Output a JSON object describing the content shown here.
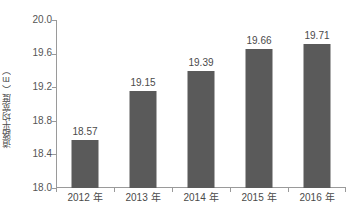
{
  "chart_data": {
    "type": "bar",
    "title": "",
    "subtitle": "",
    "xlabel": "",
    "ylabel": "道路平均宽度（m）",
    "categories": [
      "2012 年",
      "2013 年",
      "2014 年",
      "2015 年",
      "2016 年"
    ],
    "values": [
      18.57,
      19.15,
      19.39,
      19.66,
      19.71
    ],
    "data_labels": [
      "18.57",
      "19.15",
      "19.39",
      "19.66",
      "19.71"
    ],
    "ylim": [
      18.0,
      20.0
    ],
    "ytick_step": 0.4,
    "ytick_labels": [
      "20.0",
      "19.6",
      "19.2",
      "18.8",
      "18.4",
      "18.0"
    ],
    "ytick_values": [
      20.0,
      19.6,
      19.2,
      18.8,
      18.4,
      18.0
    ],
    "grid": false,
    "legend": false,
    "legend_position": "none",
    "series": [
      {
        "name": "道路平均宽度（m）",
        "values": [
          18.57,
          19.15,
          19.39,
          19.66,
          19.71
        ]
      }
    ],
    "colors": {
      "bar_fill": "#5a5a5a",
      "axis_line": "#9a9a9a",
      "text": "#4a4a4a",
      "background": "#ffffff"
    }
  }
}
